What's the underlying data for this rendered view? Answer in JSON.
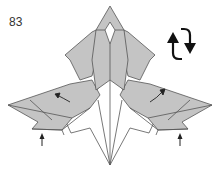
{
  "diagram": {
    "step_number": "83",
    "fill_color": "#c4c4c4",
    "white_color": "#ffffff",
    "line_color": "#555555",
    "arrow_color": "#222222",
    "symbols": [
      {
        "name": "turn-over-icon",
        "meaning": "turn model over"
      },
      {
        "name": "push-arrow-left",
        "meaning": "push up / fold inward (left)"
      },
      {
        "name": "push-arrow-right",
        "meaning": "push up / fold inward (right)"
      },
      {
        "name": "fold-arrow-left",
        "meaning": "fold flap left-up"
      },
      {
        "name": "fold-arrow-right",
        "meaning": "fold flap right-up"
      }
    ]
  }
}
